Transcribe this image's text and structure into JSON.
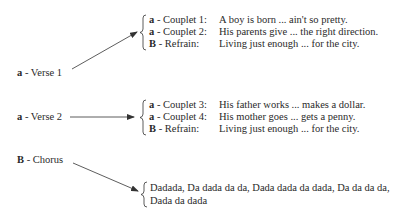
{
  "sections": [
    {
      "label_letter": "a",
      "label_text": " - Verse 1",
      "items": [
        {
          "letter": "a",
          "name": " - Couplet 1:",
          "lyric": "A boy is born ... ain't so pretty."
        },
        {
          "letter": "a",
          "name": " - Couplet 2:",
          "lyric": "His parents give ... the right direction."
        },
        {
          "letter": "B",
          "name": " - Refrain:",
          "lyric": "Living just enough ... for the city."
        }
      ]
    },
    {
      "label_letter": "a",
      "label_text": " - Verse 2",
      "items": [
        {
          "letter": "a",
          "name": " - Couplet 3:",
          "lyric": "His father works ... makes a dollar."
        },
        {
          "letter": "a",
          "name": " - Couplet 4:",
          "lyric": "His mother goes ... gets a penny."
        },
        {
          "letter": "B",
          "name": " - Refrain:",
          "lyric": "Living just enough ... for the city."
        }
      ]
    },
    {
      "label_letter": "B",
      "label_text": " - Chorus",
      "lines": [
        "Dadada, Da dada da da, Dada dada da dada, Da da da da,",
        "Dada da dada"
      ]
    }
  ]
}
